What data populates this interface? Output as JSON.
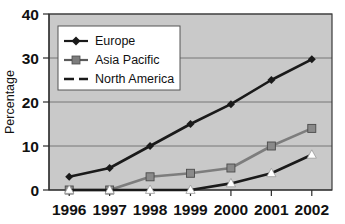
{
  "chart_data": {
    "type": "line",
    "title": "",
    "xlabel": "",
    "ylabel": "Percentage",
    "categories": [
      "1996",
      "1997",
      "1998",
      "1999",
      "2000",
      "2001",
      "2002"
    ],
    "ylim": [
      0,
      40
    ],
    "yticks": [
      0,
      10,
      20,
      30,
      40
    ],
    "grid": true,
    "legend_position": "top-left",
    "series": [
      {
        "name": "Europe",
        "marker": "diamond",
        "color": "#1a1a1a",
        "line_style": "solid",
        "values": [
          3,
          5,
          10,
          15,
          19.5,
          25,
          29.7
        ]
      },
      {
        "name": "Asia Pacific",
        "marker": "square",
        "color": "#7d7d7d",
        "line_style": "solid",
        "values": [
          0,
          0,
          3,
          3.8,
          5,
          10,
          14
        ]
      },
      {
        "name": "North America",
        "marker": "triangle",
        "color": "#1a1a1a",
        "line_style": "dashed",
        "values": [
          0,
          0,
          0,
          0,
          1.5,
          3.8,
          8
        ]
      }
    ]
  },
  "axes": {
    "y_tick_labels": [
      "0",
      "10",
      "20",
      "30",
      "40"
    ],
    "x_tick_labels": [
      "1996",
      "1997",
      "1998",
      "1999",
      "2000",
      "2001",
      "2002"
    ],
    "y_axis_title": "Percentage"
  },
  "legend": {
    "entries": [
      {
        "label": "Europe"
      },
      {
        "label": "Asia Pacific"
      },
      {
        "label": "North America"
      }
    ]
  },
  "colors": {
    "plot_background": "#c9c9c9",
    "page_background": "#ffffff",
    "gridline": "#6e6e6e",
    "series_europe": "#1a1a1a",
    "series_asia_pacific": "#7d7d7d",
    "series_north_america": "#1a1a1a"
  }
}
